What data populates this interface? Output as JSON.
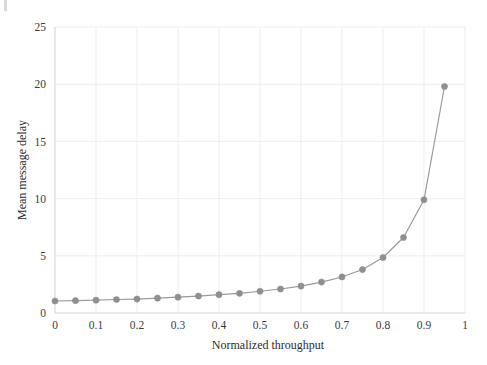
{
  "chart_data": {
    "type": "line",
    "title": "",
    "subtitle": "",
    "xlabel": "Normalized throughput",
    "ylabel": "Mean message delay",
    "xlim": [
      0,
      1
    ],
    "ylim": [
      0,
      25
    ],
    "xticks": [
      "0",
      "0.1",
      "0.2",
      "0.3",
      "0.4",
      "0.5",
      "0.6",
      "0.7",
      "0.8",
      "0.9",
      "1"
    ],
    "xtick_values": [
      0,
      0.1,
      0.2,
      0.3,
      0.4,
      0.5,
      0.6,
      0.7,
      0.8,
      0.9,
      1
    ],
    "yticks": [
      "0",
      "5",
      "10",
      "15",
      "20",
      "25"
    ],
    "ytick_values": [
      0,
      5,
      10,
      15,
      20,
      25
    ],
    "grid": true,
    "grid_color": "#ededed",
    "legend": null,
    "legend_position": "none",
    "series": [
      {
        "name": "Mean message delay",
        "color": "#9a9a9a",
        "marker": "circle",
        "marker_color": "#8f8f8f",
        "x": [
          0.0,
          0.05,
          0.1,
          0.15,
          0.2,
          0.25,
          0.3,
          0.35,
          0.4,
          0.45,
          0.5,
          0.55,
          0.6,
          0.65,
          0.7,
          0.75,
          0.8,
          0.85,
          0.9,
          0.95
        ],
        "values": [
          1.05,
          1.08,
          1.12,
          1.18,
          1.22,
          1.3,
          1.38,
          1.48,
          1.6,
          1.72,
          1.9,
          2.1,
          2.35,
          2.7,
          3.15,
          3.8,
          4.85,
          6.6,
          9.9,
          19.8
        ]
      }
    ]
  },
  "annotations": {
    "corner_mark": "tick-mark"
  }
}
